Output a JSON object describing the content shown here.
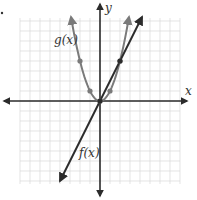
{
  "chart_data": {
    "type": "line",
    "title": "",
    "xlabel": "x",
    "ylabel": "y",
    "xlim": [
      -8,
      8
    ],
    "ylim": [
      -8,
      8
    ],
    "grid": true,
    "grid_step": 1,
    "series": [
      {
        "name": "f(x)",
        "label": "f(x)",
        "equation": "f(x) = 2x",
        "color": "#2b2b2b",
        "x": [
          -4,
          -2,
          0,
          2,
          4.2
        ],
        "values": [
          -8,
          -4,
          0,
          4,
          8.4
        ],
        "marked_points": [
          [
            0,
            0
          ],
          [
            2,
            4
          ]
        ]
      },
      {
        "name": "g(x)",
        "label": "g(x)",
        "equation": "g(x) = x^2",
        "color": "#7a7a7a",
        "x": [
          -2.9,
          -2,
          -1,
          0,
          1,
          2,
          2.9
        ],
        "values": [
          8.4,
          4,
          1,
          0,
          1,
          4,
          8.4
        ],
        "marked_points": [
          [
            -2,
            4
          ],
          [
            -1,
            1
          ],
          [
            0,
            0
          ],
          [
            1,
            1
          ],
          [
            2,
            4
          ]
        ]
      }
    ]
  },
  "labels": {
    "x_axis": "x",
    "y_axis": "y",
    "f": "f(x)",
    "g": "g(x)"
  },
  "colors": {
    "grid": "#d8d8d8",
    "axis": "#2b2b2b",
    "f": "#2b2b2b",
    "g": "#7a7a7a"
  }
}
